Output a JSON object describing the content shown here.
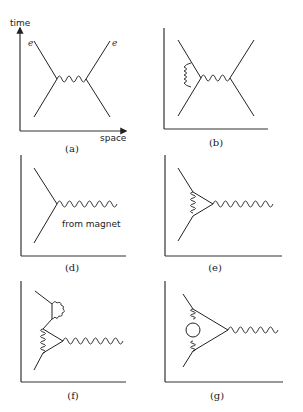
{
  "figure": {
    "axis_labels": {
      "time": "time",
      "space": "space"
    },
    "particle_label": "e",
    "annotation_from_magnet": "from magnet",
    "panels": [
      {
        "id": "a",
        "caption": "(a)",
        "description": "two electrons exchanging a photon"
      },
      {
        "id": "b",
        "caption": "(b)",
        "description": "photon exchange with self-energy loop on left electron"
      },
      {
        "id": "d",
        "caption": "(d)",
        "description": "electron interacting with external photon from magnet"
      },
      {
        "id": "e",
        "caption": "(e)",
        "description": "vertex correction"
      },
      {
        "id": "f",
        "caption": "(f)",
        "description": "vertex correction with additional self-energy loop"
      },
      {
        "id": "g",
        "caption": "(g)",
        "description": "vertex correction with vacuum polarization loop"
      }
    ]
  }
}
